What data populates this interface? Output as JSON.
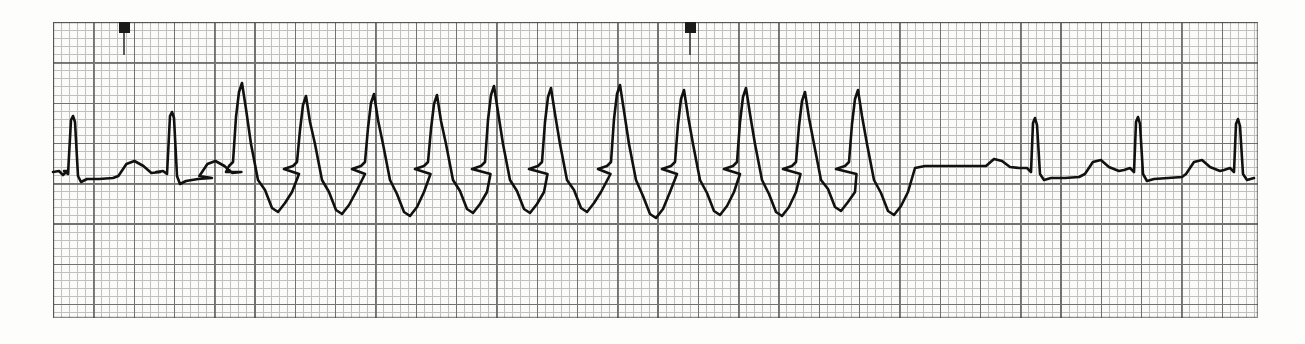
{
  "document": {
    "kind": "ecg-rhythm-strip",
    "title": "ECG rhythm strip",
    "lead_label": "",
    "background_color": "#fdfdfc",
    "trace_color": "#111111",
    "grid_minor_color": "#9d9d9d",
    "grid_major_color": "#5d5d5d",
    "paper": {
      "x": 53,
      "y": 22,
      "width": 1205,
      "height": 296
    },
    "grid": {
      "minor_square_px": 8.06,
      "major_square_px": 40.3,
      "minor_per_major": 5,
      "paper_speed": "25 mm/s",
      "gain": "10 mm/mV"
    },
    "event_markers": [
      {
        "name": "event-marker-1",
        "x": 124,
        "y": 22
      },
      {
        "name": "event-marker-2",
        "x": 690,
        "y": 22
      }
    ]
  },
  "chart_data": {
    "type": "line",
    "xlabel": "time",
    "ylabel": "amplitude",
    "grid": true,
    "legend": "none",
    "baseline_y": 170,
    "xlim": [
      53,
      1258
    ],
    "ylim": [
      22,
      318
    ],
    "segments": [
      {
        "name": "sinus-rhythm-onset",
        "x_start": 53,
        "x_end": 228,
        "beats": 2,
        "qrs": "narrow",
        "description": "baseline sinus beats with visible T waves"
      },
      {
        "name": "wide-complex-tachycardia",
        "x_start": 228,
        "x_end": 905,
        "beats": 12,
        "qrs": "wide",
        "description": "abrupt run of rapid wide-complex tachycardia with tall R peaks and deep troughs"
      },
      {
        "name": "post-conversion-pause",
        "x_start": 905,
        "x_end": 1020,
        "beats": 0,
        "qrs": "none",
        "description": "flat isoelectric pause after termination"
      },
      {
        "name": "sinus-rhythm-return",
        "x_start": 1020,
        "x_end": 1258,
        "beats": 3,
        "qrs": "narrow",
        "description": "return of narrow sinus beats with T waves"
      }
    ],
    "beats": [
      {
        "index": 1,
        "type": "sinus",
        "r_peak_x": 73,
        "r_peak_y": 116,
        "trough_y": 182
      },
      {
        "index": 2,
        "type": "sinus",
        "r_peak_x": 172,
        "r_peak_y": 112,
        "trough_y": 184
      },
      {
        "index": 3,
        "type": "tachycardia",
        "r_peak_x": 242,
        "r_peak_y": 83,
        "trough_y": 212
      },
      {
        "index": 4,
        "type": "tachycardia",
        "r_peak_x": 306,
        "r_peak_y": 96,
        "trough_y": 214
      },
      {
        "index": 5,
        "type": "tachycardia",
        "r_peak_x": 374,
        "r_peak_y": 94,
        "trough_y": 216
      },
      {
        "index": 6,
        "type": "tachycardia",
        "r_peak_x": 437,
        "r_peak_y": 95,
        "trough_y": 213
      },
      {
        "index": 7,
        "type": "tachycardia",
        "r_peak_x": 494,
        "r_peak_y": 86,
        "trough_y": 213
      },
      {
        "index": 8,
        "type": "tachycardia",
        "r_peak_x": 551,
        "r_peak_y": 88,
        "trough_y": 212
      },
      {
        "index": 9,
        "type": "tachycardia",
        "r_peak_x": 620,
        "r_peak_y": 85,
        "trough_y": 218
      },
      {
        "index": 10,
        "type": "tachycardia",
        "r_peak_x": 684,
        "r_peak_y": 90,
        "trough_y": 215
      },
      {
        "index": 11,
        "type": "tachycardia",
        "r_peak_x": 746,
        "r_peak_y": 88,
        "trough_y": 216
      },
      {
        "index": 12,
        "type": "tachycardia",
        "r_peak_x": 805,
        "r_peak_y": 92,
        "trough_y": 211
      },
      {
        "index": 13,
        "type": "tachycardia",
        "r_peak_x": 858,
        "r_peak_y": 90,
        "trough_y": 215
      },
      {
        "index": 14,
        "type": "sinus",
        "r_peak_x": 1035,
        "r_peak_y": 118,
        "trough_y": 180
      },
      {
        "index": 15,
        "type": "sinus",
        "r_peak_x": 1138,
        "r_peak_y": 117,
        "trough_y": 181
      },
      {
        "index": 16,
        "type": "sinus",
        "r_peak_x": 1238,
        "r_peak_y": 119,
        "trough_y": 180
      }
    ]
  }
}
